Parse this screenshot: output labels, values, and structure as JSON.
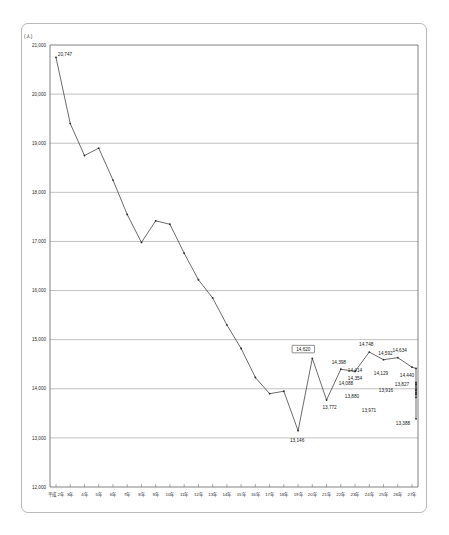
{
  "sheet": {
    "unit_label": "(人)"
  },
  "chart_data": {
    "type": "line",
    "title": "",
    "xlabel": "",
    "ylabel": "(人)",
    "ylim": [
      12000,
      21000
    ],
    "ytick_labels": [
      "21,000",
      "20,000",
      "19,000",
      "18,000",
      "17,000",
      "16,000",
      "15,000",
      "14,000",
      "13,000",
      "12,000"
    ],
    "ytick_values": [
      21000,
      20000,
      19000,
      18000,
      17000,
      16000,
      15000,
      14000,
      13000,
      12000
    ],
    "grid": true,
    "legend": false,
    "categories": [
      "平成 2年",
      "3年",
      "4年",
      "5年",
      "6年",
      "7年",
      "8年",
      "9年",
      "10年",
      "11年",
      "12年",
      "13年",
      "14年",
      "15年",
      "16年",
      "17年",
      "18年",
      "19年",
      "20年",
      "21年",
      "22年",
      "23年",
      "24年",
      "25年",
      "26年",
      "27年"
    ],
    "values": [
      20747,
      19400,
      18750,
      18900,
      18250,
      17550,
      16980,
      17420,
      17350,
      16760,
      16220,
      15850,
      15300,
      14820,
      14230,
      13900,
      13950,
      13146,
      14620,
      13772,
      14398,
      14354,
      14748,
      14592,
      14634,
      14440
    ],
    "point_labels": [
      {
        "index": 0,
        "text": "20,747",
        "boxed": false,
        "dx": 9,
        "dy": -1
      },
      {
        "index": 17,
        "text": "13,146",
        "boxed": false,
        "dx": -1,
        "dy": 11
      },
      {
        "index": 18,
        "text": "14,620",
        "boxed": true,
        "dx": -9,
        "dy": -7
      },
      {
        "index": 19,
        "text": "13,772",
        "boxed": false,
        "dx": 3,
        "dy": 9
      },
      {
        "index": 20,
        "text": "14,398",
        "boxed": false,
        "dx": -2,
        "dy": -5
      },
      {
        "index": 21,
        "text": "14,354",
        "boxed": false,
        "dx": 0,
        "dy": 9
      },
      {
        "index": 22,
        "text": "14,748",
        "boxed": false,
        "dx": -3,
        "dy": -6
      },
      {
        "index": 23,
        "text": "14,592",
        "boxed": false,
        "dx": 2,
        "dy": -5
      },
      {
        "index": 24,
        "text": "14,634",
        "boxed": false,
        "dx": 2,
        "dy": -6
      },
      {
        "index": 25,
        "text": "14,440",
        "boxed": false,
        "dx": -5,
        "dy": 10
      }
    ],
    "extra_labels": [
      {
        "text": "14,414",
        "x": 355,
        "y": 372
      },
      {
        "text": "14,088",
        "x": 346,
        "y": 385
      },
      {
        "text": "13,880",
        "x": 352,
        "y": 398
      },
      {
        "text": "13,971",
        "x": 369,
        "y": 412
      },
      {
        "text": "14,129",
        "x": 381,
        "y": 375
      },
      {
        "text": "13,916",
        "x": 386,
        "y": 392
      },
      {
        "text": "13,827",
        "x": 402,
        "y": 386
      },
      {
        "text": "13,388",
        "x": 403,
        "y": 425
      }
    ],
    "tail_values": [
      14414,
      14088,
      13880,
      13971,
      14129,
      13916,
      13827,
      13388
    ]
  }
}
